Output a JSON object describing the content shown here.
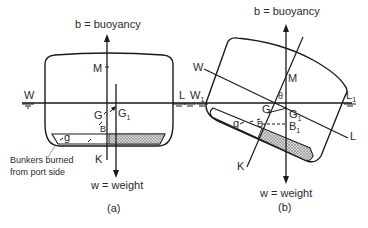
{
  "figure": {
    "panel_a": {
      "caption": "(a)",
      "buoyancy_label": "b = buoyancy",
      "weight_label": "w = weight",
      "waterline_left": "W",
      "waterline_right": "L",
      "point_M": "M",
      "point_G": "G",
      "point_G1": "G",
      "point_G1_sub": "1",
      "point_B": "B",
      "point_K": "K",
      "point_g": "g",
      "annotation_line1": "Bunkers burned",
      "annotation_line2": "from port side"
    },
    "panel_b": {
      "caption": "(b)",
      "buoyancy_label": "b = buoyancy",
      "weight_label": "w = weight",
      "waterline_W": "W",
      "waterline_L": "L",
      "waterline_W1": "W",
      "waterline_W1_sub": "1",
      "waterline_L1": "L",
      "waterline_L1_sub": "1",
      "point_M": "M",
      "angle_theta": "θ",
      "point_G": "G",
      "point_G1": "G",
      "point_G1_sub": "1",
      "point_B": "B",
      "point_B1": "B",
      "point_B1_sub": "1",
      "point_K": "K",
      "point_g": "g"
    },
    "colors": {
      "line": "#1a1a1a",
      "text": "#2a2a2a",
      "hatch": "#9a9a9a",
      "background": "#ffffff"
    }
  }
}
